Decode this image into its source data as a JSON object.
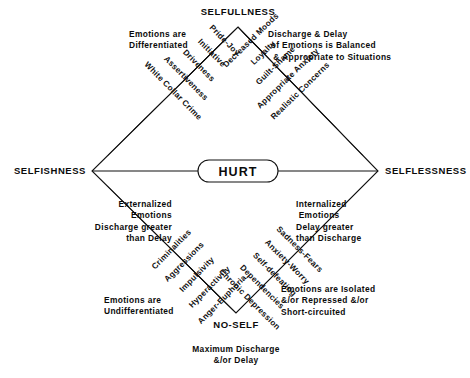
{
  "diagram": {
    "title_center": "HURT",
    "vertices": {
      "top": "SELFULLNESS",
      "left": "SELFISHNESS",
      "right": "SELFLESSNESS",
      "bottom": "NO-SELF"
    },
    "notes": {
      "top_left": "Emotions are\nDifferentiated",
      "top_right": "Discharge & Delay\n of Emotions is Balanced\n  & Appropriate to Situations",
      "left": "Externalized\nEmotions\nDischarge greater\nthan Delay",
      "right": "Internalized\n Emotions\nDelay greater\nthan Discharge",
      "bottom_left": "Emotions are\nUndifferentiated",
      "bottom_right": "Emotions are Isolated\n&/or Repressed &/or\nShort-circuited",
      "bottom_center": "Maximum Discharge\n&/or Delay"
    },
    "upper_left_spokes": [
      "White Collar Crime",
      "Assertiveness",
      "Driveness",
      "Initiative",
      "Pride-Joy"
    ],
    "upper_right_spokes": [
      "Realistic Concerns",
      "Appropriate Anxiety",
      "Guilt-Shame",
      "Loyalty",
      "Decreased Moods"
    ],
    "lower_left_spokes": [
      "Criminalities",
      "Aggressions",
      "Impulsivity",
      "Hyperactivity",
      "Anger-Euphoria"
    ],
    "lower_right_spokes": [
      "Sadness-Fears",
      "Anxiety-Worry",
      "Self-defeating",
      "Dependencies",
      "Chronic Depression"
    ],
    "colors": {
      "ink": "#0b0b0b",
      "background": "#ffffff"
    }
  }
}
